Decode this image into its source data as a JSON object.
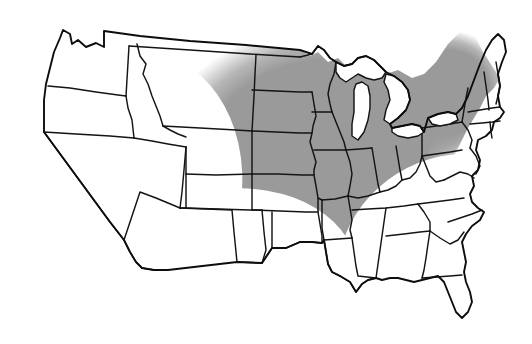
{
  "figure": {
    "kind": "choropleth-map",
    "region": "Contiguous United States",
    "background_color": "#ffffff",
    "outline_color": "#141414",
    "shade_color": "#9a9a9a",
    "shade_style": "soft-edged dithered gray ellipse",
    "unshaded_color": "#ffffff",
    "width_px": 532,
    "height_px": 344
  },
  "shaded_overlay": {
    "description": "Large soft-edged gray region sweeping from the Northern Plains southeast through the Midwest and lower Mississippi Valley, and east across the Great Lakes into the Northeast and New England.",
    "center_x_pct": 60,
    "center_y_pct": 42,
    "radius_x_pct": 42,
    "radius_y_pct": 40,
    "edge_softness": "gradient fade over ~12% of radius",
    "opacity": 1.0
  },
  "states": [
    {
      "code": "WA",
      "name": "Washington",
      "shaded": false
    },
    {
      "code": "OR",
      "name": "Oregon",
      "shaded": false
    },
    {
      "code": "CA",
      "name": "California",
      "shaded": false
    },
    {
      "code": "NV",
      "name": "Nevada",
      "shaded": false
    },
    {
      "code": "ID",
      "name": "Idaho",
      "shaded": false
    },
    {
      "code": "MT",
      "name": "Montana",
      "shaded": true
    },
    {
      "code": "WY",
      "name": "Wyoming",
      "shaded": true
    },
    {
      "code": "UT",
      "name": "Utah",
      "shaded": false
    },
    {
      "code": "AZ",
      "name": "Arizona",
      "shaded": false
    },
    {
      "code": "CO",
      "name": "Colorado",
      "shaded": false
    },
    {
      "code": "NM",
      "name": "New Mexico",
      "shaded": false
    },
    {
      "code": "ND",
      "name": "North Dakota",
      "shaded": true
    },
    {
      "code": "SD",
      "name": "South Dakota",
      "shaded": true
    },
    {
      "code": "NE",
      "name": "Nebraska",
      "shaded": true
    },
    {
      "code": "KS",
      "name": "Kansas",
      "shaded": true
    },
    {
      "code": "OK",
      "name": "Oklahoma",
      "shaded": false
    },
    {
      "code": "TX",
      "name": "Texas",
      "shaded": false
    },
    {
      "code": "MN",
      "name": "Minnesota",
      "shaded": true
    },
    {
      "code": "IA",
      "name": "Iowa",
      "shaded": true
    },
    {
      "code": "MO",
      "name": "Missouri",
      "shaded": true
    },
    {
      "code": "AR",
      "name": "Arkansas",
      "shaded": true
    },
    {
      "code": "LA",
      "name": "Louisiana",
      "shaded": true
    },
    {
      "code": "WI",
      "name": "Wisconsin",
      "shaded": true
    },
    {
      "code": "IL",
      "name": "Illinois",
      "shaded": true
    },
    {
      "code": "MS",
      "name": "Mississippi",
      "shaded": true
    },
    {
      "code": "MI",
      "name": "Michigan",
      "shaded": true
    },
    {
      "code": "IN",
      "name": "Indiana",
      "shaded": true
    },
    {
      "code": "OH",
      "name": "Ohio",
      "shaded": true
    },
    {
      "code": "KY",
      "name": "Kentucky",
      "shaded": true
    },
    {
      "code": "TN",
      "name": "Tennessee",
      "shaded": true
    },
    {
      "code": "AL",
      "name": "Alabama",
      "shaded": true
    },
    {
      "code": "GA",
      "name": "Georgia",
      "shaded": false
    },
    {
      "code": "FL",
      "name": "Florida",
      "shaded": false
    },
    {
      "code": "SC",
      "name": "South Carolina",
      "shaded": false
    },
    {
      "code": "NC",
      "name": "North Carolina",
      "shaded": false
    },
    {
      "code": "VA",
      "name": "Virginia",
      "shaded": true
    },
    {
      "code": "WV",
      "name": "West Virginia",
      "shaded": true
    },
    {
      "code": "MD",
      "name": "Maryland",
      "shaded": true
    },
    {
      "code": "DE",
      "name": "Delaware",
      "shaded": true
    },
    {
      "code": "PA",
      "name": "Pennsylvania",
      "shaded": true
    },
    {
      "code": "NJ",
      "name": "New Jersey",
      "shaded": true
    },
    {
      "code": "NY",
      "name": "New York",
      "shaded": true
    },
    {
      "code": "CT",
      "name": "Connecticut",
      "shaded": true
    },
    {
      "code": "RI",
      "name": "Rhode Island",
      "shaded": true
    },
    {
      "code": "MA",
      "name": "Massachusetts",
      "shaded": true
    },
    {
      "code": "VT",
      "name": "Vermont",
      "shaded": true
    },
    {
      "code": "NH",
      "name": "New Hampshire",
      "shaded": true
    },
    {
      "code": "ME",
      "name": "Maine",
      "shaded": true
    }
  ],
  "water_bodies": [
    {
      "name": "Lake Superior",
      "shaded": false
    },
    {
      "name": "Lake Michigan",
      "shaded": false
    },
    {
      "name": "Lake Huron",
      "shaded": false
    },
    {
      "name": "Lake Erie",
      "shaded": false
    },
    {
      "name": "Lake Ontario",
      "shaded": false
    }
  ]
}
